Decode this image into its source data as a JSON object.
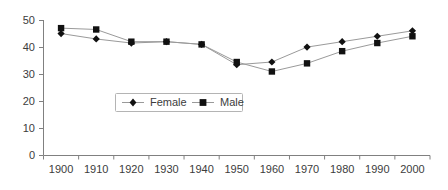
{
  "chart_data": {
    "type": "line",
    "title": "",
    "subtitle": "",
    "xlabel": "",
    "ylabel": "",
    "categories": [
      "1900",
      "1910",
      "1920",
      "1930",
      "1940",
      "1950",
      "1960",
      "1970",
      "1980",
      "1990",
      "2000"
    ],
    "x": [
      1900,
      1910,
      1920,
      1930,
      1940,
      1950,
      1960,
      1970,
      1980,
      1990,
      2000
    ],
    "xlim": [
      1895,
      2005
    ],
    "ylim": [
      0,
      50
    ],
    "yticks": [
      0,
      10,
      20,
      30,
      40,
      50
    ],
    "xticks": [
      "1900",
      "1910",
      "1920",
      "1930",
      "1940",
      "1950",
      "1960",
      "1970",
      "1980",
      "1990",
      "2000"
    ],
    "grid": false,
    "legend_position": "inside-center",
    "series": [
      {
        "name": "Female",
        "marker": "diamond",
        "values": [
          45,
          43,
          41.5,
          42,
          41,
          33.5,
          34.5,
          40,
          42,
          44,
          46
        ]
      },
      {
        "name": "Male",
        "marker": "square",
        "values": [
          47,
          46.5,
          42,
          42,
          41,
          34.5,
          31,
          34,
          38.5,
          41.5,
          44
        ]
      }
    ]
  },
  "axes": {
    "y_tick_labels": [
      "50",
      "40",
      "30",
      "20",
      "10",
      "0"
    ],
    "x_tick_labels": [
      "1900",
      "1910",
      "1920",
      "1930",
      "1940",
      "1950",
      "1960",
      "1970",
      "1980",
      "1990",
      "2000"
    ]
  },
  "legend": {
    "entries": [
      {
        "label": "Female",
        "marker": "diamond-marker"
      },
      {
        "label": "Male",
        "marker": "square-marker"
      }
    ]
  },
  "colors": {
    "axis": "#808080",
    "line": "#9a9a9a",
    "marker": "#111111",
    "text": "#3c3c3c",
    "legend_border": "#b4b4b4",
    "background": "#ffffff"
  }
}
